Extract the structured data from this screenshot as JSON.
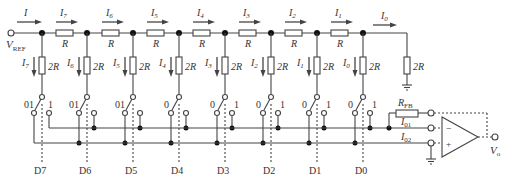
{
  "diagram": {
    "vref_label": "V",
    "vref_sub": "REF",
    "input_current_label": "I",
    "series_resistor_label": "R",
    "shunt_resistor_label": "2R",
    "feedback_resistor_label": "R",
    "feedback_resistor_sub": "FB",
    "bus1_label": "I",
    "bus1_sub": "01",
    "bus2_label": "I",
    "bus2_sub": "02",
    "output_label": "V",
    "output_sub": "o",
    "opamp_minus": "−",
    "opamp_plus": "+",
    "switch_zero_label": "0",
    "switch_one_label": "1",
    "stages": [
      {
        "bit": "D7",
        "current": "I",
        "current_sub": "7"
      },
      {
        "bit": "D6",
        "current": "I",
        "current_sub": "6"
      },
      {
        "bit": "D5",
        "current": "I",
        "current_sub": "5"
      },
      {
        "bit": "D4",
        "current": "I",
        "current_sub": "4"
      },
      {
        "bit": "D3",
        "current": "I",
        "current_sub": "3"
      },
      {
        "bit": "D2",
        "current": "I",
        "current_sub": "2"
      },
      {
        "bit": "D1",
        "current": "I",
        "current_sub": "1"
      },
      {
        "bit": "D0",
        "current": "I",
        "current_sub": "0"
      }
    ],
    "termination_current": "I",
    "termination_current_sub": "0",
    "colors": {
      "line": "#444444",
      "text": "#333333",
      "background": "#ffffff"
    }
  }
}
